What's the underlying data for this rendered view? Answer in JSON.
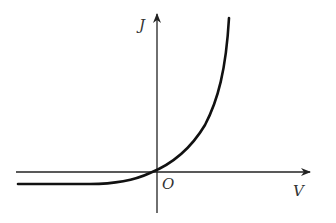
{
  "diagram": {
    "labels": {
      "y_axis": "J",
      "x_axis": "V",
      "origin": "O"
    },
    "curve": "exponential, J = Js(e^{V/Vt} - 1), saturating to -Js for negative V",
    "colors": {
      "stroke": "#111111",
      "background": "#ffffff"
    }
  }
}
